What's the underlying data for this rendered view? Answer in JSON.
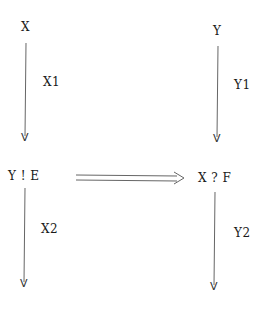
{
  "diagram": {
    "nodes": [
      {
        "id": "x",
        "label": "X"
      },
      {
        "id": "y",
        "label": "Y"
      },
      {
        "id": "y_send_e",
        "label": "Y ! E"
      },
      {
        "id": "x_recv_f",
        "label": "X ? F"
      }
    ],
    "edges": [
      {
        "id": "x1",
        "from": "X",
        "to": "Y ! E",
        "label": "X1",
        "style": "single-arrow"
      },
      {
        "id": "y1",
        "from": "Y",
        "to": "X ? F",
        "label": "Y1",
        "style": "single-arrow"
      },
      {
        "id": "x2",
        "from": "Y ! E",
        "to": "end-left",
        "label": "X2",
        "style": "single-arrow"
      },
      {
        "id": "y2",
        "from": "X ? F",
        "to": "end-right",
        "label": "Y2",
        "style": "single-arrow"
      },
      {
        "id": "sync",
        "from": "Y ! E",
        "to": "X ? F",
        "label": "",
        "style": "double-arrow"
      }
    ],
    "arrowhead_glyph": "V",
    "colors": {
      "line": "#555555",
      "text": "#1a1a1a",
      "background": "#ffffff"
    }
  }
}
